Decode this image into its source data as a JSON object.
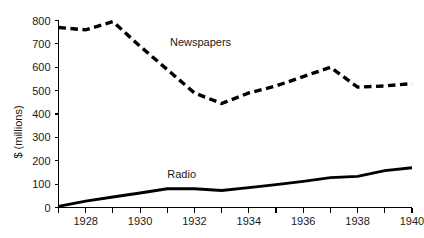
{
  "chart_data": {
    "type": "line",
    "title": "",
    "subtitle": "",
    "xlabel": "",
    "ylabel": "$ (millions)",
    "grid": false,
    "legend_position": "inline-annotations",
    "xlim": [
      1927,
      1940
    ],
    "ylim": [
      0,
      800
    ],
    "x": [
      1927,
      1928,
      1929,
      1930,
      1931,
      1932,
      1933,
      1934,
      1935,
      1936,
      1937,
      1938,
      1939,
      1940
    ],
    "xtick_values": [
      1927,
      1928,
      1929,
      1930,
      1931,
      1932,
      1933,
      1934,
      1935,
      1936,
      1937,
      1938,
      1939,
      1940
    ],
    "xtick_labels": [
      "",
      "1928",
      "",
      "1930",
      "",
      "1932",
      "",
      "1934",
      "",
      "1936",
      "",
      "1938",
      "",
      "1940"
    ],
    "ytick_values": [
      0,
      100,
      200,
      300,
      400,
      500,
      600,
      700,
      800
    ],
    "ytick_labels": [
      "0",
      "100",
      "200",
      "300",
      "400",
      "500",
      "600",
      "700",
      "800"
    ],
    "series": [
      {
        "name": "Newspapers",
        "style": "dashed",
        "color": "#000000",
        "label_x": 1931.1,
        "label_y": 690,
        "values": [
          770,
          760,
          795,
          690,
          590,
          490,
          445,
          490,
          520,
          560,
          600,
          515,
          520,
          530
        ]
      },
      {
        "name": "Radio",
        "style": "solid",
        "color": "#000000",
        "label_x": 1931.0,
        "label_y": 125,
        "values": [
          5,
          27,
          45,
          62,
          80,
          80,
          73,
          85,
          98,
          112,
          128,
          133,
          158,
          170
        ]
      }
    ]
  },
  "axis_titles": {
    "y": "$ (millions)"
  },
  "series_labels": {
    "newspapers": "Newspapers",
    "radio": "Radio"
  }
}
